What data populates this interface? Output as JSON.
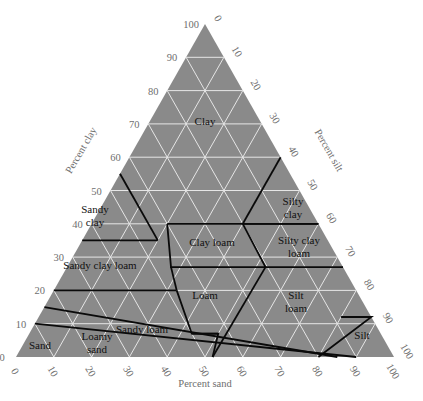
{
  "chart_data": {
    "type": "ternary",
    "title": "",
    "axes": {
      "clay": {
        "label": "Percent clay",
        "ticks": [
          "0",
          "10",
          "20",
          "30",
          "40",
          "50",
          "60",
          "70",
          "80",
          "90",
          "100"
        ]
      },
      "silt": {
        "label": "Percent silt",
        "ticks": [
          "0",
          "10",
          "20",
          "30",
          "40",
          "50",
          "60",
          "70",
          "80",
          "90",
          "100"
        ]
      },
      "sand": {
        "label": "Percent sand",
        "ticks": [
          "100",
          "90",
          "80",
          "70",
          "60",
          "50",
          "40",
          "30",
          "20",
          "10",
          "0"
        ]
      }
    },
    "grid": true,
    "colors": {
      "fill": "#8a8a8a",
      "grid": "#e6e6e6",
      "boundary": "#0a0a0a",
      "tick": "#6e6e6e"
    },
    "regions": [
      {
        "name": "Clay",
        "label": [
          "Clay"
        ]
      },
      {
        "name": "Sandy clay",
        "label": [
          "Sandy",
          "clay"
        ]
      },
      {
        "name": "Silty clay",
        "label": [
          "Silty",
          "clay"
        ]
      },
      {
        "name": "Clay loam",
        "label": [
          "Clay loam"
        ]
      },
      {
        "name": "Silty clay loam",
        "label": [
          "Silty clay",
          "loam"
        ]
      },
      {
        "name": "Sandy clay loam",
        "label": [
          "Sandy clay loam"
        ]
      },
      {
        "name": "Loam",
        "label": [
          "Loam"
        ]
      },
      {
        "name": "Silt loam",
        "label": [
          "Silt",
          "loam"
        ]
      },
      {
        "name": "Sandy loam",
        "label": [
          "Sandy loam"
        ]
      },
      {
        "name": "Loamy sand",
        "label": [
          "Loamy",
          "sand"
        ]
      },
      {
        "name": "Sand",
        "label": [
          "Sand"
        ]
      },
      {
        "name": "Silt",
        "label": [
          "Silt"
        ]
      }
    ]
  }
}
